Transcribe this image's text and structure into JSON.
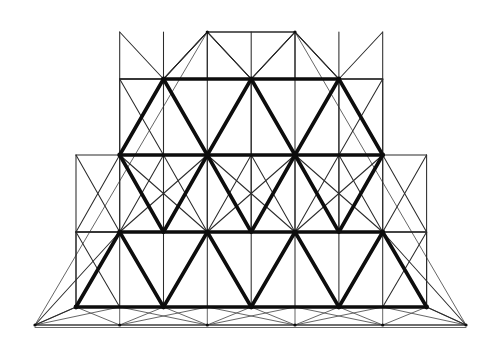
{
  "figure": {
    "kind": "geometric-line-drawing",
    "width": 503,
    "height": 343,
    "background_color": "#ffffff",
    "bold_stroke_color": "#0d0d0d",
    "thin_stroke_color": "#2b2b2b",
    "hair_stroke_color": "#4a4a4a",
    "bold_stroke_width": 3.6,
    "thin_stroke_width": 1.05,
    "hair_stroke_width": 0.85,
    "row_count": 5,
    "row_y": [
      32,
      79,
      155,
      232,
      307
    ],
    "row_labels": [
      "apex-row",
      "row-2",
      "row-3",
      "row-4",
      "base-row"
    ],
    "base_outer_y": 325,
    "cell_half_width": 43.8,
    "rows": [
      {
        "index": 0,
        "y": 32,
        "x": [
          207.3,
          295.0
        ]
      },
      {
        "index": 1,
        "y": 79,
        "x": [
          163.5,
          251.2,
          338.9
        ]
      },
      {
        "index": 2,
        "y": 155,
        "x": [
          119.7,
          207.3,
          295.0,
          382.7
        ]
      },
      {
        "index": 3,
        "y": 232,
        "x": [
          119.7,
          207.3,
          295.0,
          382.7
        ]
      },
      {
        "index": 4,
        "y": 307,
        "x": [
          76.0,
          163.5,
          251.2,
          338.9,
          426.6
        ]
      }
    ],
    "bold_edges": [
      [
        163.5,
        79,
        251.2,
        79
      ],
      [
        251.2,
        79,
        338.9,
        79
      ],
      [
        119.7,
        155,
        207.3,
        155
      ],
      [
        207.3,
        155,
        295.0,
        155
      ],
      [
        295.0,
        155,
        382.7,
        155
      ],
      [
        119.7,
        232,
        207.3,
        232
      ],
      [
        207.3,
        232,
        295.0,
        232
      ],
      [
        295.0,
        232,
        382.7,
        232
      ],
      [
        76.0,
        307,
        163.5,
        307
      ],
      [
        163.5,
        307,
        251.2,
        307
      ],
      [
        251.2,
        307,
        338.9,
        307
      ],
      [
        338.9,
        307,
        426.6,
        307
      ],
      [
        163.5,
        79,
        119.7,
        155
      ],
      [
        163.5,
        79,
        207.3,
        155
      ],
      [
        251.2,
        79,
        207.3,
        155
      ],
      [
        251.2,
        79,
        295.0,
        155
      ],
      [
        338.9,
        79,
        295.0,
        155
      ],
      [
        338.9,
        79,
        382.7,
        155
      ],
      [
        119.7,
        155,
        163.5,
        232
      ],
      [
        207.3,
        155,
        163.5,
        232
      ],
      [
        207.3,
        155,
        251.2,
        232
      ],
      [
        295.0,
        155,
        251.2,
        232
      ],
      [
        295.0,
        155,
        338.9,
        232
      ],
      [
        382.7,
        155,
        338.9,
        232
      ],
      [
        119.7,
        232,
        76.0,
        307
      ],
      [
        119.7,
        232,
        163.5,
        307
      ],
      [
        207.3,
        232,
        163.5,
        307
      ],
      [
        207.3,
        232,
        251.2,
        307
      ],
      [
        295.0,
        232,
        251.2,
        307
      ],
      [
        295.0,
        232,
        338.9,
        307
      ],
      [
        382.7,
        232,
        338.9,
        307
      ],
      [
        382.7,
        232,
        426.6,
        307
      ]
    ],
    "thin_edges": [
      [
        207.3,
        32,
        295.0,
        32
      ],
      [
        207.3,
        32,
        207.3,
        79
      ],
      [
        295.0,
        32,
        295.0,
        79
      ],
      [
        207.3,
        32,
        163.5,
        79
      ],
      [
        295.0,
        32,
        338.9,
        79
      ],
      [
        207.3,
        32,
        251.2,
        79
      ],
      [
        295.0,
        32,
        251.2,
        79
      ],
      [
        163.5,
        79,
        207.3,
        32
      ],
      [
        163.5,
        79,
        163.5,
        155
      ],
      [
        251.2,
        79,
        251.2,
        155
      ],
      [
        338.9,
        79,
        338.9,
        155
      ],
      [
        163.5,
        79,
        251.2,
        79
      ],
      [
        119.7,
        155,
        207.3,
        155
      ],
      [
        163.5,
        79,
        119.7,
        79
      ],
      [
        338.9,
        79,
        382.7,
        79
      ],
      [
        119.7,
        79,
        119.7,
        155
      ],
      [
        382.7,
        79,
        382.7,
        155
      ],
      [
        119.7,
        79,
        163.5,
        79
      ],
      [
        338.9,
        79,
        382.7,
        79
      ],
      [
        119.7,
        79,
        163.5,
        155
      ],
      [
        382.7,
        79,
        338.9,
        155
      ],
      [
        163.5,
        79,
        119.7,
        79
      ],
      [
        119.7,
        155,
        119.7,
        232
      ],
      [
        163.5,
        155,
        163.5,
        232
      ],
      [
        207.3,
        155,
        207.3,
        232
      ],
      [
        251.2,
        155,
        251.2,
        232
      ],
      [
        295.0,
        155,
        295.0,
        232
      ],
      [
        338.9,
        155,
        338.9,
        232
      ],
      [
        382.7,
        155,
        382.7,
        232
      ],
      [
        119.7,
        155,
        382.7,
        155
      ],
      [
        76.0,
        232,
        119.7,
        232
      ],
      [
        382.7,
        232,
        426.6,
        232
      ],
      [
        76.0,
        232,
        76.0,
        307
      ],
      [
        426.6,
        232,
        426.6,
        307
      ],
      [
        76.0,
        232,
        426.6,
        232
      ],
      [
        76.0,
        232,
        119.7,
        307
      ],
      [
        426.6,
        232,
        382.7,
        307
      ],
      [
        76.0,
        307,
        426.6,
        307
      ],
      [
        35.0,
        325,
        466.0,
        325
      ],
      [
        35.0,
        325,
        76.0,
        307
      ],
      [
        466.0,
        325,
        426.6,
        307
      ],
      [
        35.0,
        325,
        119.7,
        232
      ],
      [
        466.0,
        325,
        382.7,
        232
      ],
      [
        119.7,
        232,
        76.0,
        232
      ],
      [
        163.5,
        79,
        119.7,
        155
      ],
      [
        251.2,
        79,
        295.0,
        155
      ]
    ],
    "node_rows": [
      {
        "y": 32,
        "x": [
          207.3,
          295.0
        ]
      },
      {
        "y": 79,
        "x": [
          119.7,
          163.5,
          207.3,
          251.2,
          295.0,
          338.9,
          382.7
        ]
      },
      {
        "y": 155,
        "x": [
          76.0,
          119.7,
          163.5,
          207.3,
          251.2,
          295.0,
          338.9,
          382.7,
          426.6
        ]
      },
      {
        "y": 232,
        "x": [
          76.0,
          119.7,
          163.5,
          207.3,
          251.2,
          295.0,
          338.9,
          382.7,
          426.6
        ]
      },
      {
        "y": 307,
        "x": [
          76.0,
          119.7,
          163.5,
          207.3,
          251.2,
          295.0,
          338.9,
          382.7,
          426.6
        ]
      },
      {
        "y": 325,
        "x": [
          35.0,
          119.7,
          207.3,
          295.0,
          382.7,
          466.0
        ]
      }
    ],
    "bold_nodes": [
      [
        163.5,
        79
      ],
      [
        251.2,
        79
      ],
      [
        338.9,
        79
      ],
      [
        119.7,
        155
      ],
      [
        207.3,
        155
      ],
      [
        295.0,
        155
      ],
      [
        382.7,
        155
      ],
      [
        119.7,
        232
      ],
      [
        207.3,
        232
      ],
      [
        295.0,
        232
      ],
      [
        382.7,
        232
      ],
      [
        76.0,
        307
      ],
      [
        163.5,
        307
      ],
      [
        251.2,
        307
      ],
      [
        338.9,
        307
      ],
      [
        426.6,
        307
      ]
    ]
  }
}
